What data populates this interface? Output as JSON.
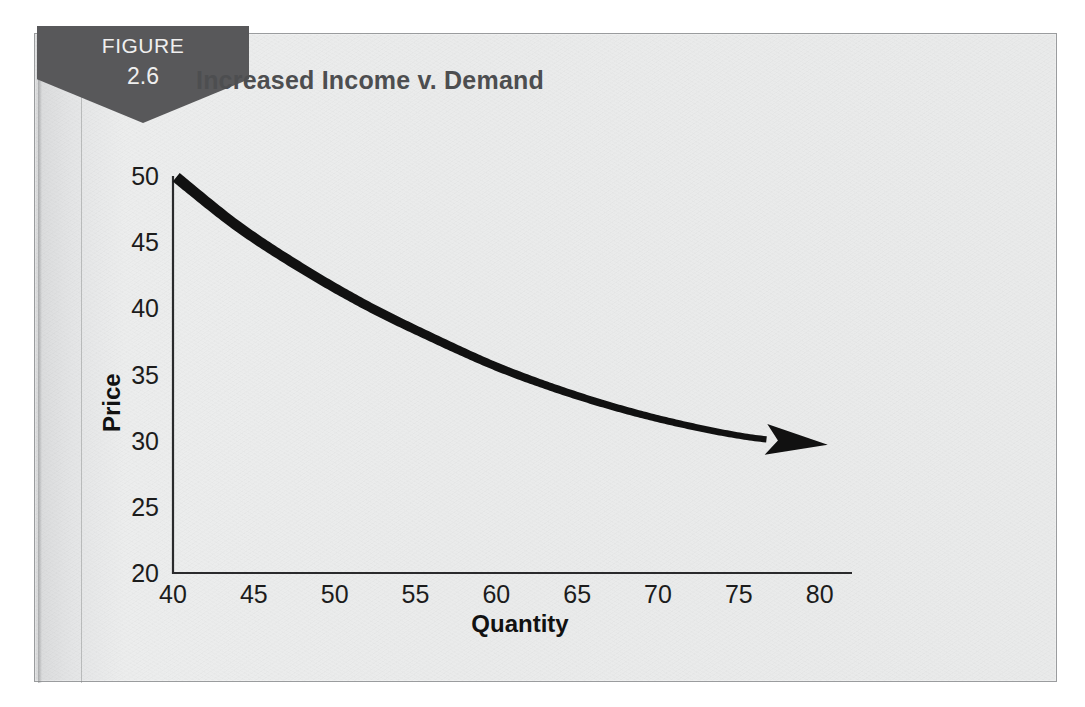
{
  "figure": {
    "banner_word": "FIGURE",
    "banner_number": "2.6",
    "banner_color": "#58585a",
    "banner_text_color": "#efefef"
  },
  "chart_data": {
    "type": "line",
    "title": "Increased Income v. Demand",
    "xlabel": "Quantity",
    "ylabel": "Price",
    "xlim": [
      40,
      82
    ],
    "ylim": [
      20,
      50
    ],
    "xticks": [
      "40",
      "45",
      "50",
      "55",
      "60",
      "65",
      "70",
      "75",
      "80"
    ],
    "xtick_values": [
      40,
      45,
      50,
      55,
      60,
      65,
      70,
      75,
      80
    ],
    "yticks": [
      "20",
      "25",
      "30",
      "35",
      "40",
      "45",
      "50"
    ],
    "ytick_values": [
      20,
      25,
      30,
      35,
      40,
      45,
      50
    ],
    "grid": false,
    "legend": null,
    "series": [
      {
        "name": "Demand",
        "style": "tapered-arrow-curve",
        "color": "#111111",
        "arrow_head": true,
        "x": [
          40.2,
          44,
          48,
          52,
          56,
          60,
          64,
          68,
          72,
          76,
          80.5
        ],
        "y": [
          49.9,
          46.2,
          43.0,
          40.2,
          37.8,
          35.6,
          33.8,
          32.3,
          31.1,
          30.2,
          29.7
        ]
      }
    ],
    "annotations": []
  },
  "colors": {
    "panel_background": "#e9eaea",
    "panel_border": "#9a9c9e",
    "title_text": "#4d4e50",
    "axis": "#2a2a2c",
    "curve": "#111111",
    "page_background": "#ffffff"
  }
}
